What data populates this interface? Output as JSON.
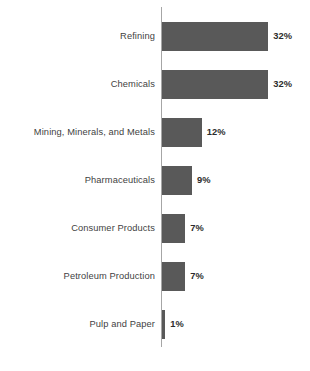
{
  "chart_data": {
    "type": "bar",
    "orientation": "horizontal",
    "title": "",
    "xlabel": "",
    "ylabel": "",
    "xlim": [
      0,
      32
    ],
    "grid": false,
    "legend": false,
    "categories": [
      "Refining",
      "Chemicals",
      "Mining, Minerals, and Metals",
      "Pharmaceuticals",
      "Consumer Products",
      "Petroleum Production",
      "Pulp and Paper"
    ],
    "values": [
      32,
      32,
      12,
      9,
      7,
      7,
      1
    ],
    "value_labels": [
      "32%",
      "32%",
      "12%",
      "9%",
      "7%",
      "7%",
      "1%"
    ],
    "bar_color": "#595959",
    "axis_color": "#a6a6a6",
    "label_color": "#3f3f3f",
    "value_color": "#2b2b2b",
    "background": "#ffffff"
  },
  "caption": {
    "text": ""
  }
}
